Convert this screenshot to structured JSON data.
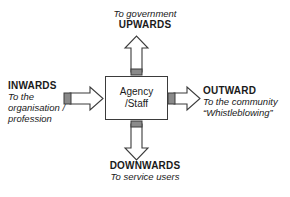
{
  "diagram": {
    "center": {
      "name": "agency-staff-box",
      "line1": "Agency",
      "line2": "/Staff"
    },
    "directions": {
      "up": {
        "label": "UPWARDS",
        "description": "To government",
        "arrow": "arrow-up"
      },
      "down": {
        "label": "DOWNWARDS",
        "description": "To service users",
        "arrow": "arrow-down"
      },
      "left": {
        "label": "INWARDS",
        "description_line1": "To the",
        "description_line2": "organisation /",
        "description_line3": "profession",
        "arrow": "arrow-right-inward"
      },
      "right": {
        "label": "OUTWARD",
        "description_line1": "To the community",
        "description_line2": "“Whistleblowing”",
        "arrow": "arrow-right-outward"
      }
    },
    "colors": {
      "stroke": "#3b3b3b",
      "fill": "#ffffff",
      "tail_segment": "#7d7d7d",
      "text": "#1a1a1a",
      "background": "#ffffff"
    }
  }
}
